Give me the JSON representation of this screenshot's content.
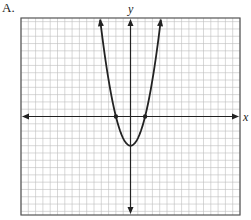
{
  "option_label": "A.",
  "chart_data": {
    "type": "line",
    "title": "",
    "xlabel": "x",
    "ylabel": "y",
    "function": "y = x^2 - 4",
    "x_intercepts": [
      [
        -2,
        0
      ],
      [
        2,
        0
      ]
    ],
    "vertex": [
      0,
      -4
    ],
    "xlim": [
      -15,
      15
    ],
    "ylim": [
      -13.5,
      13.5
    ],
    "grid": true,
    "legend": null,
    "points": [
      {
        "x": -4.6,
        "y": 17.2
      },
      {
        "x": -3,
        "y": 5
      },
      {
        "x": -2,
        "y": 0
      },
      {
        "x": -1,
        "y": -3
      },
      {
        "x": 0,
        "y": -4
      },
      {
        "x": 1,
        "y": -3
      },
      {
        "x": 2,
        "y": 0
      },
      {
        "x": 3,
        "y": 5
      },
      {
        "x": 4.6,
        "y": 17.2
      }
    ]
  },
  "colors": {
    "grid": "#bdbdbd",
    "frame": "#555555",
    "axis": "#222222",
    "curve": "#222222"
  }
}
